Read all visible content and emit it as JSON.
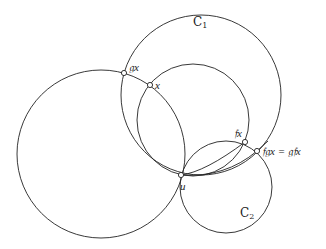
{
  "figure": {
    "labels": {
      "C1": "C",
      "C1_sub": "1",
      "C2": "C",
      "C2_sub": "2",
      "gx": "𝔤x",
      "x": "x",
      "fx": "𝔣x",
      "fgx": "𝔣𝔤x = 𝔤𝔣x",
      "u": "u"
    },
    "colors": {
      "stroke": "#222222",
      "background": "#ffffff"
    }
  }
}
